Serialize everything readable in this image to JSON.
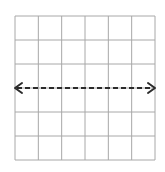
{
  "diagram": {
    "type": "coordinate-grid",
    "grid": {
      "columns": 6,
      "rows": 6,
      "left": 15,
      "top": 16,
      "width": 140,
      "height": 144,
      "line_color": "#a8a8a8",
      "line_width": 1
    },
    "line": {
      "style": "dashed",
      "orientation": "horizontal",
      "row_index": 3,
      "arrowheads": [
        "left",
        "right"
      ],
      "color": "#2b2b2b",
      "width": 2,
      "dash": "5,3"
    }
  }
}
